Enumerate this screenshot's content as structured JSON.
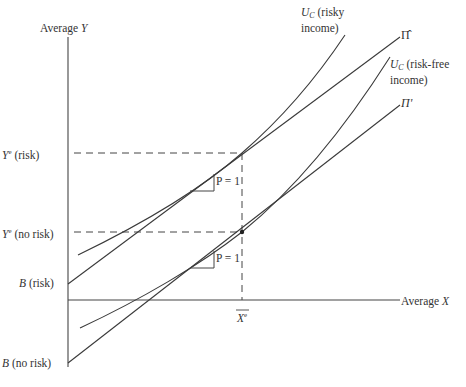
{
  "diagram": {
    "type": "economics-diagram",
    "axes": {
      "y_label_prefix": "Average ",
      "y_label_var": "Y",
      "x_label_prefix": "Average ",
      "x_label_var": "X"
    },
    "y_ticks": [
      {
        "var": "Y",
        "sup": "e",
        "text": " (risk)"
      },
      {
        "var": "Y",
        "sup": "e",
        "text": " (no risk)"
      }
    ],
    "intercepts": [
      {
        "var": "B",
        "text": " (risk)"
      },
      {
        "var": "B",
        "text": " (no risk)"
      }
    ],
    "x_tick": {
      "var": "X",
      "sup": "e",
      "overbar": true
    },
    "curves": [
      {
        "name": "U",
        "sub": "C",
        "label_line1": " (risky",
        "label_line2": "income)"
      },
      {
        "name": "U",
        "sub": "C",
        "label_line1": " (risk-free",
        "label_line2": "income)"
      }
    ],
    "lines": [
      {
        "label": "Π̂"
      },
      {
        "label": "Π'"
      }
    ],
    "slope_marks": [
      {
        "text": "P = 1"
      },
      {
        "text": "P = 1"
      }
    ],
    "colors": {
      "stroke": "#3a3a3a",
      "background": "#ffffff"
    }
  }
}
